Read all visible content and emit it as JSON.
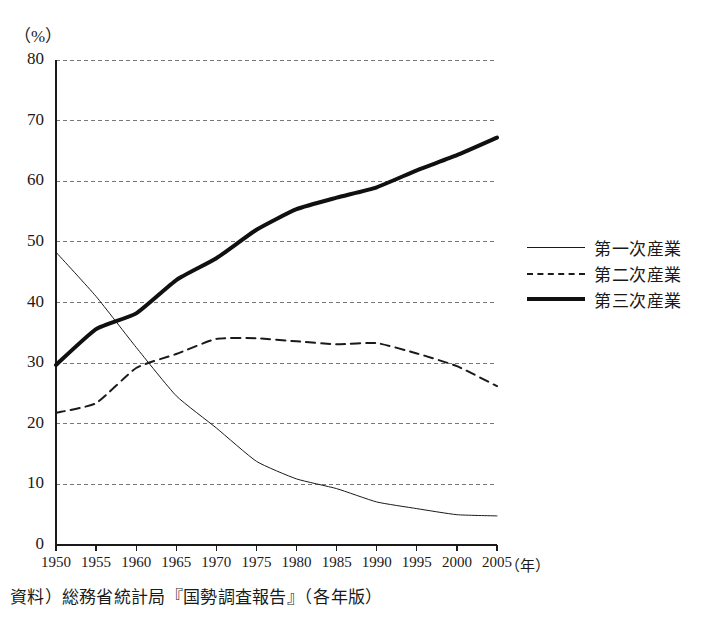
{
  "figure": {
    "unit_label": "（%）",
    "source_note": "資料）総務省統計局『国勢調査報告』（各年版）",
    "xaxis_unit": "（年）"
  },
  "legend": {
    "position": "right",
    "items": [
      {
        "label": "第一次産業",
        "style": "thin-solid"
      },
      {
        "label": "第二次産業",
        "style": "dashed"
      },
      {
        "label": "第三次産業",
        "style": "thick-solid"
      }
    ]
  },
  "chart_data": {
    "type": "line",
    "title": "",
    "subtitle": "",
    "xlabel": "（年）",
    "ylabel": "（%）",
    "x": [
      1950,
      1955,
      1960,
      1965,
      1970,
      1975,
      1980,
      1985,
      1990,
      1995,
      2000,
      2005
    ],
    "categories": [
      "1950",
      "1955",
      "1960",
      "1965",
      "1970",
      "1975",
      "1980",
      "1985",
      "1990",
      "1995",
      "2000",
      "2005"
    ],
    "xlim": [
      1950,
      2005
    ],
    "ylim": [
      0,
      80
    ],
    "yticks": [
      0,
      10,
      20,
      30,
      40,
      50,
      60,
      70,
      80
    ],
    "ytick_labels": [
      "0",
      "10",
      "20",
      "30",
      "40",
      "50",
      "60",
      "70",
      "80"
    ],
    "grid": "horizontal-dashed",
    "legend_position": "right",
    "series": [
      {
        "name": "第一次産業",
        "style": "thin-solid",
        "color": "#1a1a1a",
        "width": 1,
        "values": [
          48.3,
          41.0,
          32.6,
          24.6,
          19.3,
          13.8,
          10.9,
          9.3,
          7.1,
          6.0,
          5.0,
          4.8
        ]
      },
      {
        "name": "第二次産業",
        "style": "dashed",
        "color": "#1a1a1a",
        "width": 2,
        "values": [
          21.8,
          23.4,
          29.2,
          31.5,
          34.0,
          34.1,
          33.6,
          33.1,
          33.3,
          31.6,
          29.5,
          26.2
        ]
      },
      {
        "name": "第三次産業",
        "style": "thick-solid",
        "color": "#101010",
        "width": 4,
        "values": [
          29.7,
          35.6,
          38.2,
          43.7,
          47.3,
          52.0,
          55.4,
          57.3,
          59.0,
          61.8,
          64.3,
          67.2
        ]
      }
    ]
  }
}
